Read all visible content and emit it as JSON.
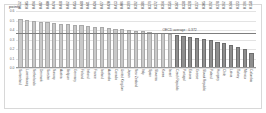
{
  "chart": {
    "unit_label": "points",
    "average_label": "OECD average : 0.372"
  },
  "chart_data": {
    "type": "bar",
    "title": "",
    "subtitle": "",
    "xlabel": "",
    "ylabel": "points",
    "ylim": [
      0.0,
      0.6
    ],
    "yticks": [
      "0.6",
      "0.5",
      "0.4",
      "0.3",
      "0.2",
      "0.1",
      "0.0"
    ],
    "grid": true,
    "legend_position": "none",
    "average_line": 0.372,
    "average_label": "OECD average : 0.372",
    "categories": [
      "Switzerland",
      "Luxembourg",
      "Netherlands",
      "Denmark",
      "Sweden",
      "Norway",
      "Austria",
      "Belgium",
      "Germany",
      "Finland",
      "Ireland",
      "France",
      "Iceland",
      "Australia",
      "Canada",
      "United Kingdom",
      "Japan",
      "New Zealand",
      "Italy",
      "Spain",
      "Slovenia",
      "Korea",
      "Israel",
      "Czech Republic",
      "Portugal",
      "Estonia",
      "Greece",
      "Slovak Republic",
      "Poland",
      "Hungary",
      "Chile",
      "Latvia",
      "Turkey",
      "Mexico",
      "Colombia"
    ],
    "values": [
      0.512,
      0.505,
      0.494,
      0.487,
      0.48,
      0.474,
      0.468,
      0.462,
      0.455,
      0.448,
      0.441,
      0.434,
      0.427,
      0.42,
      0.413,
      0.406,
      0.399,
      0.392,
      0.386,
      0.379,
      0.372,
      0.364,
      0.356,
      0.347,
      0.338,
      0.328,
      0.317,
      0.305,
      0.292,
      0.278,
      0.262,
      0.244,
      0.223,
      0.196,
      0.158
    ],
    "bar_shades": [
      "light",
      "light",
      "light",
      "light",
      "light",
      "light",
      "light",
      "light",
      "light",
      "light",
      "light",
      "light",
      "light",
      "light",
      "light",
      "light",
      "light",
      "light",
      "light",
      "light",
      "light",
      "light",
      "light",
      "dark",
      "dark",
      "dark",
      "dark",
      "dark",
      "dark",
      "dark",
      "dark",
      "dark",
      "dark",
      "dark",
      "dark"
    ],
    "colors": {
      "bar_light": "#c9c9c9",
      "bar_dark": "#8e8e8e",
      "average_line": "#7d7d7d",
      "grid": "#e3e3e3",
      "text": "#4a4a4a"
    }
  }
}
